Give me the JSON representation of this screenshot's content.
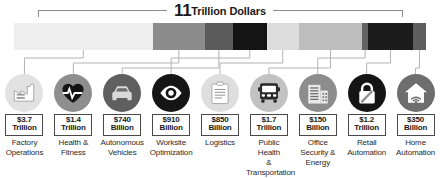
{
  "title": {
    "number": "11",
    "words": "Trillion Dollars"
  },
  "chart_data": {
    "type": "bar",
    "subtitle": "",
    "xlabel": "",
    "ylabel": "",
    "orientation": "horizontal-stacked",
    "unit": "US dollars",
    "total": "11 Trillion Dollars",
    "grid": false,
    "legend": "none",
    "categories": [
      "Factory Operations",
      "Health & Fitness",
      "Autonomous Vehicles",
      "Worksite Optimization",
      "Logistics",
      "Public Health & Transportation",
      "Office Security & Energy",
      "Retail Automation",
      "Home Automation"
    ],
    "values": [
      3.7,
      1.4,
      0.74,
      0.91,
      0.85,
      1.7,
      0.15,
      1.2,
      0.35
    ],
    "value_labels": [
      "$3.7 Trillion",
      "$1.4 Trillion",
      "$740 Billion",
      "$910 Billion",
      "$850 Billion",
      "$1.7 Trillion",
      "$150 Billion",
      "$1.2 Trillion",
      "$350 Billion"
    ],
    "segment_colors": [
      "#eeeeee",
      "#8c8c8c",
      "#5b5b5b",
      "#141414",
      "#dcdcdc",
      "#bdbdbd",
      "#636363",
      "#1c1c1c",
      "#5e5e5e"
    ]
  },
  "segments": [
    {
      "id": "factory-operations",
      "amount": "$3.7",
      "unit": "Trillion",
      "caption": "Factory\nOperations",
      "icon": "factory-icon",
      "bar_color": "#eeeeee",
      "circle_color": "#e2e2e2",
      "glyph_color": "#ffffff",
      "glyph_outline": "#9a9a9a"
    },
    {
      "id": "health-and-fitness",
      "amount": "$1.4",
      "unit": "Trillion",
      "caption": "Health &\nFitness",
      "icon": "heartbeat-icon",
      "bar_color": "#8c8c8c",
      "circle_color": "#8e8e8e",
      "glyph_color": "#141414",
      "glyph_outline": "#141414"
    },
    {
      "id": "autonomous-vehicles",
      "amount": "$740",
      "unit": "Billion",
      "caption": "Autonomous\nVehicles",
      "icon": "car-icon",
      "bar_color": "#5b5b5b",
      "circle_color": "#5f5f5f",
      "glyph_color": "#d8d8d8",
      "glyph_outline": "#d8d8d8"
    },
    {
      "id": "worksite-optimization",
      "amount": "$910",
      "unit": "Billion",
      "caption": "Worksite\nOptimization",
      "icon": "eye-icon",
      "bar_color": "#141414",
      "circle_color": "#151515",
      "glyph_color": "#ffffff",
      "glyph_outline": "#ffffff"
    },
    {
      "id": "logistics",
      "amount": "$850",
      "unit": "Billion",
      "caption": "Logistics",
      "icon": "clipboard-icon",
      "bar_color": "#dcdcdc",
      "circle_color": "#dedede",
      "glyph_color": "#ffffff",
      "glyph_outline": "#9a9a9a"
    },
    {
      "id": "public-health-and-transportation",
      "amount": "$1.7",
      "unit": "Trillion",
      "caption": "Public\nHealth\n&\nTransportation",
      "icon": "bus-icon",
      "bar_color": "#bdbdbd",
      "circle_color": "#c2c2c2",
      "glyph_color": "#272727",
      "glyph_outline": "#272727"
    },
    {
      "id": "office-security-and-energy",
      "amount": "$150",
      "unit": "Billion",
      "caption": "Office\nSecurity &\nEnergy",
      "icon": "office-building-icon",
      "bar_color": "#636363",
      "circle_color": "#8d8d8d",
      "glyph_color": "#e8e8e8",
      "glyph_outline": "#e8e8e8"
    },
    {
      "id": "retail-automation",
      "amount": "$1.2",
      "unit": "Trillion",
      "caption": "Retail\nAutomation",
      "icon": "padlock-icon",
      "bar_color": "#1c1c1c",
      "circle_color": "#151515",
      "glyph_color": "#ffffff",
      "glyph_outline": "#ffffff"
    },
    {
      "id": "home-automation",
      "amount": "$350",
      "unit": "Billion",
      "caption": "Home\nAutomation",
      "icon": "home-wifi-icon",
      "bar_color": "#5e5e5e",
      "circle_color": "#6e6e6e",
      "glyph_color": "#ffffff",
      "glyph_outline": "#ffffff"
    }
  ]
}
